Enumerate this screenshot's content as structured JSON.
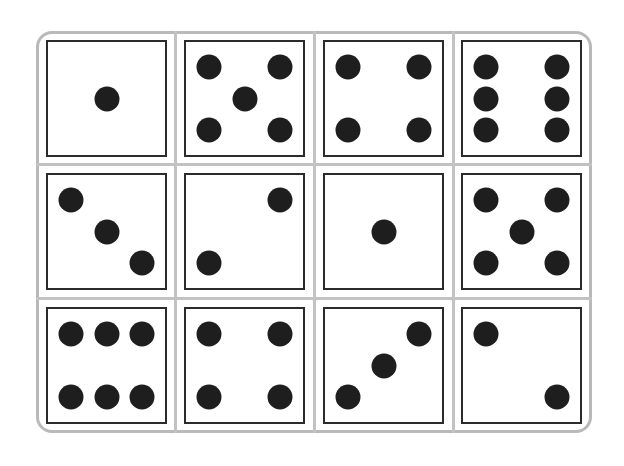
{
  "colors": {
    "frame": "#b9b9b9",
    "die_border": "#2b2b2b",
    "pip": "#1e1e1e",
    "background": "#ffffff"
  },
  "grid": {
    "rows": 3,
    "cols": 4
  },
  "dice": [
    {
      "row": 0,
      "col": 0,
      "value": 1,
      "pips": [
        [
          0.5,
          0.5
        ]
      ]
    },
    {
      "row": 0,
      "col": 1,
      "value": 5,
      "pips": [
        [
          0.2,
          0.22
        ],
        [
          0.8,
          0.22
        ],
        [
          0.5,
          0.5
        ],
        [
          0.2,
          0.78
        ],
        [
          0.8,
          0.78
        ]
      ]
    },
    {
      "row": 0,
      "col": 2,
      "value": 4,
      "pips": [
        [
          0.2,
          0.22
        ],
        [
          0.8,
          0.22
        ],
        [
          0.2,
          0.78
        ],
        [
          0.8,
          0.78
        ]
      ]
    },
    {
      "row": 0,
      "col": 3,
      "value": 6,
      "pips": [
        [
          0.2,
          0.22
        ],
        [
          0.8,
          0.22
        ],
        [
          0.2,
          0.5
        ],
        [
          0.8,
          0.5
        ],
        [
          0.2,
          0.78
        ],
        [
          0.8,
          0.78
        ]
      ]
    },
    {
      "row": 1,
      "col": 0,
      "value": 3,
      "pips": [
        [
          0.2,
          0.22
        ],
        [
          0.5,
          0.5
        ],
        [
          0.8,
          0.78
        ]
      ]
    },
    {
      "row": 1,
      "col": 1,
      "value": 2,
      "pips": [
        [
          0.8,
          0.22
        ],
        [
          0.2,
          0.78
        ]
      ]
    },
    {
      "row": 1,
      "col": 2,
      "value": 1,
      "pips": [
        [
          0.5,
          0.5
        ]
      ]
    },
    {
      "row": 1,
      "col": 3,
      "value": 5,
      "pips": [
        [
          0.2,
          0.22
        ],
        [
          0.8,
          0.22
        ],
        [
          0.5,
          0.5
        ],
        [
          0.2,
          0.78
        ],
        [
          0.8,
          0.78
        ]
      ]
    },
    {
      "row": 2,
      "col": 0,
      "value": 6,
      "pips": [
        [
          0.2,
          0.22
        ],
        [
          0.5,
          0.22
        ],
        [
          0.8,
          0.22
        ],
        [
          0.2,
          0.78
        ],
        [
          0.5,
          0.78
        ],
        [
          0.8,
          0.78
        ]
      ]
    },
    {
      "row": 2,
      "col": 1,
      "value": 4,
      "pips": [
        [
          0.2,
          0.22
        ],
        [
          0.8,
          0.22
        ],
        [
          0.2,
          0.78
        ],
        [
          0.8,
          0.78
        ]
      ]
    },
    {
      "row": 2,
      "col": 2,
      "value": 3,
      "pips": [
        [
          0.8,
          0.22
        ],
        [
          0.5,
          0.5
        ],
        [
          0.2,
          0.78
        ]
      ]
    },
    {
      "row": 2,
      "col": 3,
      "value": 2,
      "pips": [
        [
          0.2,
          0.22
        ],
        [
          0.8,
          0.78
        ]
      ]
    }
  ]
}
